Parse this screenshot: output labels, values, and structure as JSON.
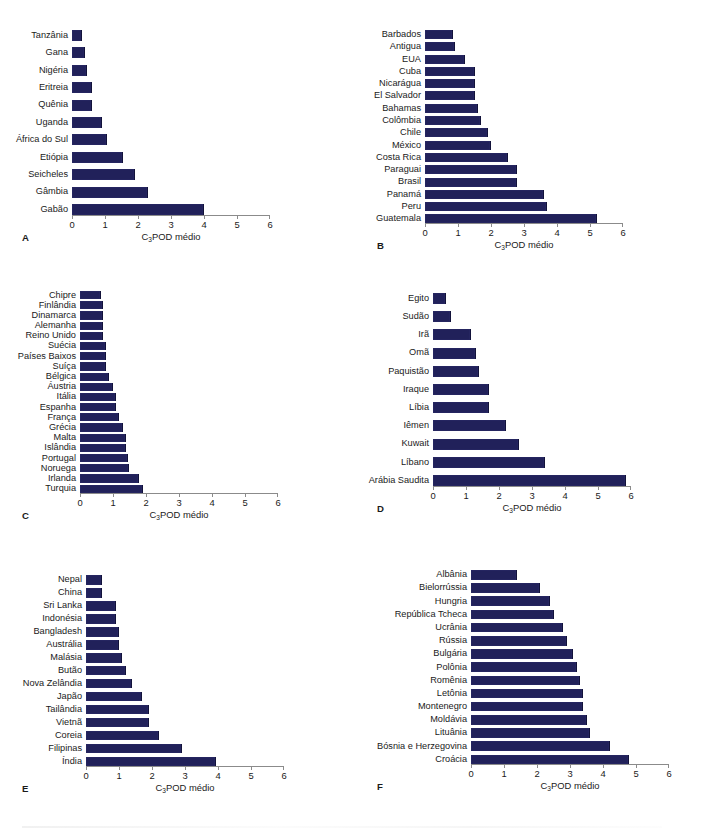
{
  "figure": {
    "width": 709,
    "height": 832,
    "bar_color": "#21215a",
    "axis_color": "#8b8b8b",
    "background": "#ffffff"
  },
  "axis": {
    "title_prefix": "C",
    "title_subscript": "3",
    "title_suffix": "POD médio",
    "title_full": "C3POD médio",
    "ticks": [
      "0",
      "1",
      "2",
      "3",
      "4",
      "5",
      "6"
    ],
    "min": 0,
    "max": 6
  },
  "chart_data": [
    {
      "type": "bar",
      "panel": "A",
      "orientation": "horizontal",
      "title": "",
      "xlabel": "C3POD médio",
      "ylabel": "",
      "xlim": [
        0,
        6
      ],
      "grid": false,
      "legend": "none",
      "categories": [
        "Tanzânia",
        "Gana",
        "Nigéria",
        "Eritreia",
        "Quênia",
        "Uganda",
        "África do Sul",
        "Etiópia",
        "Seicheles",
        "Gâmbia",
        "Gabão"
      ],
      "values": [
        0.3,
        0.4,
        0.45,
        0.6,
        0.6,
        0.9,
        1.05,
        1.55,
        1.9,
        2.3,
        4.0
      ]
    },
    {
      "type": "bar",
      "panel": "B",
      "orientation": "horizontal",
      "title": "",
      "xlabel": "C3POD médio",
      "ylabel": "",
      "xlim": [
        0,
        6
      ],
      "grid": false,
      "legend": "none",
      "categories": [
        "Barbados",
        "Antigua",
        "EUA",
        "Cuba",
        "Nicarágua",
        "El Salvador",
        "Bahamas",
        "Colômbia",
        "Chile",
        "México",
        "Costa Rica",
        "Paraguai",
        "Brasil",
        "Panamá",
        "Peru",
        "Guatemala"
      ],
      "values": [
        0.85,
        0.9,
        1.2,
        1.5,
        1.5,
        1.5,
        1.6,
        1.7,
        1.9,
        2.0,
        2.5,
        2.8,
        2.8,
        3.6,
        3.7,
        5.2
      ]
    },
    {
      "type": "bar",
      "panel": "C",
      "orientation": "horizontal",
      "title": "",
      "xlabel": "C3POD médio",
      "ylabel": "",
      "xlim": [
        0,
        6
      ],
      "grid": false,
      "legend": "none",
      "categories": [
        "Chipre",
        "Finlândia",
        "Dinamarca",
        "Alemanha",
        "Reino Unido",
        "Suécia",
        "Países Baixos",
        "Suíça",
        "Bélgica",
        "Áustria",
        "Itália",
        "Espanha",
        "França",
        "Grécia",
        "Malta",
        "Islândia",
        "Portugal",
        "Noruega",
        "Irlanda",
        "Turquia"
      ],
      "values": [
        0.65,
        0.7,
        0.7,
        0.7,
        0.7,
        0.78,
        0.78,
        0.8,
        0.88,
        1.0,
        1.1,
        1.1,
        1.18,
        1.3,
        1.38,
        1.38,
        1.45,
        1.48,
        1.78,
        1.9
      ]
    },
    {
      "type": "bar",
      "panel": "D",
      "orientation": "horizontal",
      "title": "",
      "xlabel": "C3POD médio",
      "ylabel": "",
      "xlim": [
        0,
        6
      ],
      "grid": false,
      "legend": "none",
      "categories": [
        "Egito",
        "Sudão",
        "Irã",
        "Omã",
        "Paquistão",
        "Iraque",
        "Líbia",
        "Iêmen",
        "Kuwait",
        "Líbano",
        "Arábia Saudita"
      ],
      "values": [
        0.4,
        0.55,
        1.15,
        1.3,
        1.4,
        1.7,
        1.7,
        2.2,
        2.6,
        3.4,
        5.85
      ]
    },
    {
      "type": "bar",
      "panel": "E",
      "orientation": "horizontal",
      "title": "",
      "xlabel": "C3POD médio",
      "ylabel": "",
      "xlim": [
        0,
        6
      ],
      "grid": false,
      "legend": "none",
      "categories": [
        "Nepal",
        "China",
        "Sri Lanka",
        "Indonésia",
        "Bangladesh",
        "Austrália",
        "Malásia",
        "Butão",
        "Nova Zelândia",
        "Japão",
        "Tailândia",
        "Vietnã",
        "Coreia",
        "Filipinas",
        "Índia"
      ],
      "values": [
        0.48,
        0.48,
        0.9,
        0.9,
        1.0,
        1.0,
        1.1,
        1.2,
        1.4,
        1.7,
        1.9,
        1.9,
        2.2,
        2.9,
        3.95
      ]
    },
    {
      "type": "bar",
      "panel": "F",
      "orientation": "horizontal",
      "title": "",
      "xlabel": "C3POD médio",
      "ylabel": "",
      "xlim": [
        0,
        6
      ],
      "grid": false,
      "legend": "none",
      "categories": [
        "Albânia",
        "Bielorrússia",
        "Hungria",
        "República Tcheca",
        "Ucrânia",
        "Rússia",
        "Bulgária",
        "Polônia",
        "Romênia",
        "Letônia",
        "Montenegro",
        "Moldávia",
        "Lituânia",
        "Bósnia e Herzegovina",
        "Croácia"
      ],
      "values": [
        1.4,
        2.1,
        2.4,
        2.5,
        2.8,
        2.9,
        3.1,
        3.2,
        3.3,
        3.4,
        3.4,
        3.5,
        3.6,
        4.2,
        4.8
      ]
    }
  ],
  "panels": [
    {
      "letter": "A",
      "label_col_px": 72,
      "axis_px": 198,
      "bar_h": 11,
      "gap": 6.4,
      "top": 30,
      "left": 0,
      "letter_x": 22,
      "letter_y": 262
    },
    {
      "letter": "B",
      "label_col_px": 70,
      "axis_px": 198,
      "bar_h": 9.0,
      "gap": 3.3,
      "top": 30,
      "left": 355,
      "letter_x": 22,
      "letter_y": 262
    },
    {
      "letter": "C",
      "label_col_px": 80,
      "axis_px": 198,
      "bar_h": 8.2,
      "gap": 2.0,
      "top": 291,
      "left": 0,
      "letter_x": 22,
      "letter_y": 530
    },
    {
      "letter": "D",
      "label_col_px": 78,
      "axis_px": 198,
      "bar_h": 11,
      "gap": 7.2,
      "top": 293,
      "left": 355,
      "letter_x": 22,
      "letter_y": 530
    },
    {
      "letter": "E",
      "label_col_px": 86,
      "axis_px": 198,
      "bar_h": 9.6,
      "gap": 3.4,
      "top": 575,
      "left": 0,
      "letter_x": 22,
      "letter_y": 806
    },
    {
      "letter": "F",
      "label_col_px": 116,
      "axis_px": 198,
      "bar_h": 9.6,
      "gap": 3.6,
      "top": 570,
      "left": 355,
      "letter_x": 22,
      "letter_y": 806
    }
  ]
}
